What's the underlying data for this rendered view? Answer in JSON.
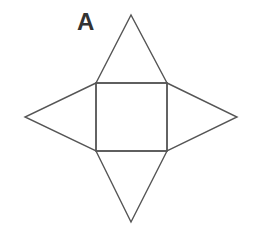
{
  "figure": {
    "label": "A",
    "stroke_color": "#555555",
    "label_color": "#333333",
    "square": {
      "x1": 96,
      "y1": 83,
      "x2": 167,
      "y2": 151
    },
    "triangles": {
      "top": {
        "apex": [
          131,
          15
        ]
      },
      "left": {
        "apex": [
          25,
          117
        ]
      },
      "right": {
        "apex": [
          237,
          117
        ]
      },
      "bottom": {
        "apex": [
          131,
          222
        ]
      }
    }
  }
}
